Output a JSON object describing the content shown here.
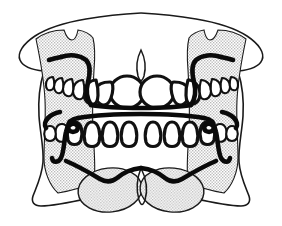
{
  "figure": {
    "caption": "",
    "alt_text": "Line drawing of maxillary and mandibular dental arches viewed from the front, each fitted with a removable retainer whose heavy labial bow crosses the anterior teeth and whose Adams clasps engage the posterior molars.",
    "style": "black-ink line art on white with gray stippled bone shading",
    "background_color": "#ffffff",
    "ink_color": "#111111",
    "shade_color": "#d8d8d8",
    "wire_color": "#0a0a0a"
  },
  "anatomy": {
    "upper_arch_label": "maxillary-arch",
    "lower_arch_label": "mandibular-arch",
    "midline_label": "midline-raphe",
    "condyle_left_label": "left-condyle",
    "condyle_right_label": "right-condyle",
    "upper_teeth_count": 12,
    "lower_teeth_count": 12,
    "upper_incisor_count": 4,
    "lower_incisor_count": 4
  },
  "appliance": {
    "name": "removable retainer",
    "upper_labial_bow_label": "upper-labial-bow",
    "lower_labial_bow_label": "lower-labial-bow",
    "clasp_count": 4,
    "clasp_upper_left_label": "upper-left-clasp",
    "clasp_upper_right_label": "upper-right-clasp",
    "clasp_lower_left_label": "lower-left-clasp",
    "clasp_lower_right_label": "lower-right-clasp",
    "retention_arm_left_label": "left-retention-arm",
    "retention_arm_right_label": "right-retention-arm"
  },
  "annotations": {
    "labels": [],
    "callouts": []
  }
}
